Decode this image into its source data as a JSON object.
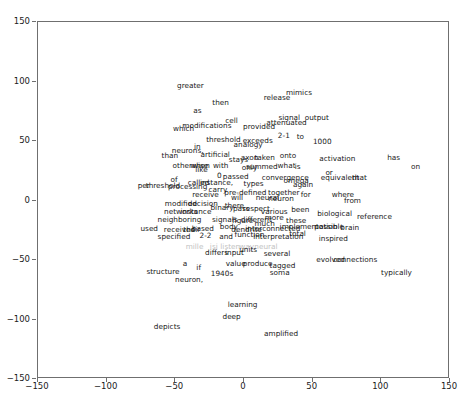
{
  "chart_data": {
    "type": "scatter",
    "title": "",
    "xlabel": "",
    "ylabel": "",
    "xlim": [
      -150,
      150
    ],
    "ylim": [
      -150,
      150
    ],
    "grid": false,
    "legend": null,
    "marker": "text-label",
    "xticks": [
      -150,
      -100,
      -50,
      0,
      50,
      100,
      150
    ],
    "yticks": [
      -150,
      -100,
      -50,
      0,
      50,
      100,
      150
    ],
    "xticklabels": [
      "-150",
      "-100",
      "-50",
      "0",
      "50",
      "100",
      "150"
    ],
    "yticklabels": [
      "-150",
      "-100",
      "-50",
      "0",
      "50",
      "100",
      "150"
    ],
    "points": [
      {
        "label": "greater",
        "x": -39,
        "y": 96,
        "faint": false
      },
      {
        "label": "mimics",
        "x": 40,
        "y": 90,
        "faint": false
      },
      {
        "label": "release",
        "x": 24,
        "y": 86,
        "faint": false
      },
      {
        "label": "then",
        "x": -17,
        "y": 82,
        "faint": false
      },
      {
        "label": "as",
        "x": -34,
        "y": 75,
        "faint": false
      },
      {
        "label": "signal",
        "x": 33,
        "y": 69,
        "faint": false
      },
      {
        "label": "output",
        "x": 53,
        "y": 69,
        "faint": false
      },
      {
        "label": "cell",
        "x": -9,
        "y": 67,
        "faint": false
      },
      {
        "label": "attenuated",
        "x": 31,
        "y": 65,
        "faint": false
      },
      {
        "label": "modifications",
        "x": -27,
        "y": 63,
        "faint": false
      },
      {
        "label": "provided",
        "x": 11,
        "y": 62,
        "faint": false
      },
      {
        "label": "which",
        "x": -44,
        "y": 60,
        "faint": false
      },
      {
        "label": "2-1",
        "x": 29,
        "y": 54,
        "faint": false
      },
      {
        "label": "to",
        "x": 41,
        "y": 53,
        "faint": false
      },
      {
        "label": "threshold",
        "x": -15,
        "y": 51,
        "faint": false
      },
      {
        "label": "exceeds",
        "x": 10,
        "y": 50,
        "faint": false
      },
      {
        "label": "1000",
        "x": 57,
        "y": 49,
        "faint": false
      },
      {
        "label": "analogy",
        "x": 3,
        "y": 47,
        "faint": false
      },
      {
        "label": "in",
        "x": -34,
        "y": 45,
        "faint": false
      },
      {
        "label": "neurons,",
        "x": -41,
        "y": 42,
        "faint": false
      },
      {
        "label": "artificial",
        "x": -21,
        "y": 38,
        "faint": false
      },
      {
        "label": "axon",
        "x": 4,
        "y": 36,
        "faint": false
      },
      {
        "label": "taken",
        "x": 15,
        "y": 36,
        "faint": false
      },
      {
        "label": "onto",
        "x": 32,
        "y": 37,
        "faint": false
      },
      {
        "label": "than",
        "x": -54,
        "y": 37,
        "faint": false
      },
      {
        "label": "stays",
        "x": -4,
        "y": 34,
        "faint": false
      },
      {
        "label": "activation",
        "x": 68,
        "y": 35,
        "faint": false
      },
      {
        "label": "has",
        "x": 109,
        "y": 36,
        "faint": false
      },
      {
        "label": "otherwise",
        "x": -39,
        "y": 29,
        "faint": false
      },
      {
        "label": "when",
        "x": -32,
        "y": 29,
        "faint": false
      },
      {
        "label": "with",
        "x": -17,
        "y": 29,
        "faint": false
      },
      {
        "label": "summed",
        "x": 13,
        "y": 28,
        "faint": false
      },
      {
        "label": "what",
        "x": 31,
        "y": 29,
        "faint": false
      },
      {
        "label": "is",
        "x": 39,
        "y": 28,
        "faint": false
      },
      {
        "label": "on",
        "x": 125,
        "y": 28,
        "faint": false
      },
      {
        "label": "only",
        "x": 4,
        "y": 27,
        "faint": false
      },
      {
        "label": "like",
        "x": -31,
        "y": 26,
        "faint": false
      },
      {
        "label": "or",
        "x": 62,
        "y": 23,
        "faint": false
      },
      {
        "label": "0",
        "x": -18,
        "y": 21,
        "faint": false
      },
      {
        "label": "passed",
        "x": -6,
        "y": 20,
        "faint": false
      },
      {
        "label": "equivalent",
        "x": 70,
        "y": 19,
        "faint": false
      },
      {
        "label": "that",
        "x": 84,
        "y": 19,
        "faint": false
      },
      {
        "label": "convergence",
        "x": 30,
        "y": 19,
        "faint": false
      },
      {
        "label": "of",
        "x": -51,
        "y": 17,
        "faint": false
      },
      {
        "label": "called",
        "x": -33,
        "y": 15,
        "faint": false
      },
      {
        "label": "instance,",
        "x": -20,
        "y": 15,
        "faint": false
      },
      {
        "label": "types",
        "x": 7,
        "y": 14,
        "faint": false
      },
      {
        "label": "omega",
        "x": 38,
        "y": 16,
        "faint": false
      },
      {
        "label": "again",
        "x": 43,
        "y": 13,
        "faint": false
      },
      {
        "label": "per",
        "x": -73,
        "y": 12,
        "faint": false
      },
      {
        "label": "threshold",
        "x": -59,
        "y": 12,
        "faint": false
      },
      {
        "label": "processing",
        "x": -41,
        "y": 11,
        "faint": false
      },
      {
        "label": "carry",
        "x": -19,
        "y": 9,
        "faint": false
      },
      {
        "label": "pre-defined",
        "x": 1,
        "y": 6,
        "faint": false
      },
      {
        "label": "together",
        "x": 29,
        "y": 6,
        "faint": false
      },
      {
        "label": "for",
        "x": 45,
        "y": 5,
        "faint": false
      },
      {
        "label": "where",
        "x": 72,
        "y": 5,
        "faint": false
      },
      {
        "label": "receive",
        "x": -28,
        "y": 5,
        "faint": false
      },
      {
        "label": "will",
        "x": -5,
        "y": 2,
        "faint": false
      },
      {
        "label": "neural",
        "x": 17,
        "y": 2,
        "faint": false
      },
      {
        "label": "neuron",
        "x": 27,
        "y": 1,
        "faint": false
      },
      {
        "label": "from",
        "x": 79,
        "y": 0,
        "faint": false
      },
      {
        "label": "modified",
        "x": -46,
        "y": -3,
        "faint": false
      },
      {
        "label": "decision",
        "x": -30,
        "y": -3,
        "faint": false
      },
      {
        "label": "binary",
        "x": -16,
        "y": -6,
        "faint": false
      },
      {
        "label": "there",
        "x": -7,
        "y": -5,
        "faint": false
      },
      {
        "label": "pass",
        "x": -2,
        "y": -7,
        "faint": false
      },
      {
        "label": "respect",
        "x": 9,
        "y": -7,
        "faint": false
      },
      {
        "label": "been",
        "x": 41,
        "y": -8,
        "faint": false
      },
      {
        "label": "various",
        "x": 22,
        "y": -10,
        "faint": false
      },
      {
        "label": "networks",
        "x": -46,
        "y": -10,
        "faint": false
      },
      {
        "label": "instance",
        "x": -35,
        "y": -10,
        "faint": false
      },
      {
        "label": "biological",
        "x": 66,
        "y": -11,
        "faint": false
      },
      {
        "label": "reference",
        "x": 95,
        "y": -14,
        "faint": false
      },
      {
        "label": "neighboring",
        "x": -47,
        "y": -16,
        "faint": false
      },
      {
        "label": "signals",
        "x": -14,
        "y": -16,
        "faint": false
      },
      {
        "label": "figure",
        "x": -1,
        "y": -17,
        "faint": false
      },
      {
        "label": "different",
        "x": 9,
        "y": -16,
        "faint": false
      },
      {
        "label": "more",
        "x": 22,
        "y": -15,
        "faint": false
      },
      {
        "label": "these",
        "x": 38,
        "y": -17,
        "faint": false
      },
      {
        "label": "much",
        "x": 15,
        "y": -20,
        "faint": false
      },
      {
        "label": "implementation",
        "x": 47,
        "y": -22,
        "faint": false
      },
      {
        "label": "possible",
        "x": 62,
        "y": -22,
        "faint": false
      },
      {
        "label": "brain",
        "x": 77,
        "y": -23,
        "faint": false
      },
      {
        "label": "used",
        "x": -69,
        "y": -24,
        "faint": false
      },
      {
        "label": "body",
        "x": -11,
        "y": -22,
        "faint": false
      },
      {
        "label": "received",
        "x": -47,
        "y": -25,
        "faint": false
      },
      {
        "label": "their",
        "x": -38,
        "y": -25,
        "faint": false
      },
      {
        "label": "based",
        "x": -30,
        "y": -24,
        "faint": false
      },
      {
        "label": "dendrite",
        "x": 2,
        "y": -25,
        "faint": false
      },
      {
        "label": "interconnected",
        "x": 21,
        "y": -24,
        "faint": false
      },
      {
        "label": "total",
        "x": 39,
        "y": -28,
        "faint": false
      },
      {
        "label": "2-2",
        "x": -28,
        "y": -30,
        "faint": false
      },
      {
        "label": "and",
        "x": -13,
        "y": -31,
        "faint": false
      },
      {
        "label": "function",
        "x": 4,
        "y": -29,
        "faint": false
      },
      {
        "label": "interpretation",
        "x": 25,
        "y": -31,
        "faint": false
      },
      {
        "label": "inspired",
        "x": 65,
        "y": -32,
        "faint": false
      },
      {
        "label": "specified",
        "x": -51,
        "y": -31,
        "faint": false
      },
      {
        "label": "mille",
        "x": -36,
        "y": -39,
        "faint": true
      },
      {
        "label": "isi",
        "x": -22,
        "y": -39,
        "faint": true
      },
      {
        "label": "listen",
        "x": -10,
        "y": -39,
        "faint": true
      },
      {
        "label": "way",
        "x": 2,
        "y": -39,
        "faint": true
      },
      {
        "label": "neural",
        "x": 16,
        "y": -39,
        "faint": true
      },
      {
        "label": "differs",
        "x": -20,
        "y": -44,
        "faint": false
      },
      {
        "label": "input",
        "x": -7,
        "y": -44,
        "faint": false
      },
      {
        "label": "units",
        "x": 3,
        "y": -42,
        "faint": false
      },
      {
        "label": "several",
        "x": 24,
        "y": -45,
        "faint": false
      },
      {
        "label": "evolved",
        "x": 63,
        "y": -50,
        "faint": false
      },
      {
        "label": "connections",
        "x": 81,
        "y": -50,
        "faint": false
      },
      {
        "label": "value",
        "x": -6,
        "y": -53,
        "faint": false
      },
      {
        "label": "produce",
        "x": 10,
        "y": -53,
        "faint": false
      },
      {
        "label": "tagged",
        "x": 28,
        "y": -55,
        "faint": false
      },
      {
        "label": "a",
        "x": -43,
        "y": -53,
        "faint": false
      },
      {
        "label": "if",
        "x": -33,
        "y": -57,
        "faint": false
      },
      {
        "label": "structure",
        "x": -59,
        "y": -60,
        "faint": false
      },
      {
        "label": "soma",
        "x": 26,
        "y": -61,
        "faint": false
      },
      {
        "label": "typically",
        "x": 111,
        "y": -61,
        "faint": false
      },
      {
        "label": "1940s",
        "x": -16,
        "y": -62,
        "faint": false
      },
      {
        "label": "neuron,",
        "x": -40,
        "y": -67,
        "faint": false
      },
      {
        "label": "learning",
        "x": -1,
        "y": -88,
        "faint": false
      },
      {
        "label": "deep",
        "x": -9,
        "y": -98,
        "faint": false
      },
      {
        "label": "depicts",
        "x": -56,
        "y": -106,
        "faint": false
      },
      {
        "label": "amplified",
        "x": 27,
        "y": -112,
        "faint": false
      }
    ]
  }
}
